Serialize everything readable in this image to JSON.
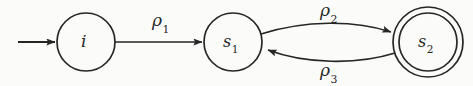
{
  "diagram": {
    "type": "state-machine",
    "title": "",
    "canvas": {
      "width": 473,
      "height": 86
    },
    "background_color": "#fbfbfa",
    "stroke_color": "#262626",
    "states": [
      {
        "id": "i",
        "label": "i",
        "label_sub": "",
        "kind": "initial",
        "shape": "circle",
        "double": false,
        "cx": 86,
        "cy": 42,
        "r": 29
      },
      {
        "id": "s1",
        "label": "s",
        "label_sub": "1",
        "kind": "normal",
        "shape": "circle",
        "double": false,
        "cx": 233,
        "cy": 42,
        "r": 29
      },
      {
        "id": "s2",
        "label": "s",
        "label_sub": "2",
        "kind": "accepting",
        "shape": "double-circle",
        "double": true,
        "cx": 428,
        "cy": 42,
        "r": 35,
        "r_inner": 29
      }
    ],
    "transitions": [
      {
        "id": "start",
        "label": "",
        "label_sub": "",
        "from": null,
        "to": "i",
        "style": "straight",
        "direction": "right"
      },
      {
        "id": "rho1",
        "label": "ρ",
        "label_sub": "1",
        "from": "i",
        "to": "s1",
        "style": "straight",
        "direction": "right",
        "label_x": 164,
        "label_y": 14
      },
      {
        "id": "rho2",
        "label": "ρ",
        "label_sub": "2",
        "from": "s1",
        "to": "s2",
        "style": "arc-above",
        "direction": "right",
        "label_x": 332,
        "label_y": 5
      },
      {
        "id": "rho3",
        "label": "ρ",
        "label_sub": "3",
        "from": "s2",
        "to": "s1",
        "style": "arc-below",
        "direction": "left",
        "label_x": 332,
        "label_y": 62
      }
    ]
  }
}
